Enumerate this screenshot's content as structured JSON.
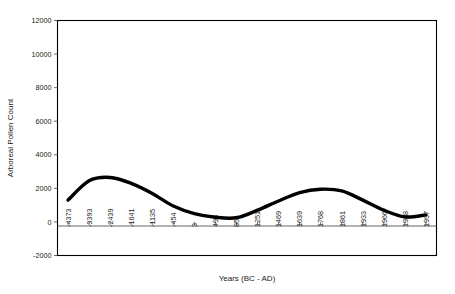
{
  "chart_data": {
    "type": "line",
    "title": "",
    "xlabel": "Years (BC - AD)",
    "ylabel": "Arboreal Pollen Count",
    "grid": false,
    "legend": false,
    "ylim": [
      -2000,
      12000
    ],
    "ytick_labels": [
      "12000",
      "10000",
      "8000",
      "6000",
      "4000",
      "2000",
      "0",
      "-2000"
    ],
    "ytick_values": [
      12000,
      10000,
      8000,
      6000,
      4000,
      2000,
      0,
      -2000
    ],
    "categories": [
      "-4373",
      "-3393",
      "-2439",
      "-1641",
      "-1135",
      "-454",
      "3",
      "498",
      "854",
      "1251",
      "1469",
      "1639",
      "1768",
      "1861",
      "1933",
      "1966",
      "1988",
      "1997"
    ],
    "x": [
      -4373,
      -3393,
      -2439,
      -1641,
      -1135,
      -454,
      3,
      498,
      854,
      1251,
      1469,
      1639,
      1768,
      1861,
      1933,
      1966,
      1988,
      1997
    ],
    "values": [
      1300,
      2450,
      2650,
      2300,
      1700,
      950,
      500,
      280,
      250,
      700,
      1250,
      1750,
      1950,
      1850,
      1300,
      700,
      300,
      420
    ],
    "series_name": "Arboreal Pollen Count",
    "line_color": "#000000",
    "axis_color": "#000000",
    "background_color": "#ffffff"
  }
}
